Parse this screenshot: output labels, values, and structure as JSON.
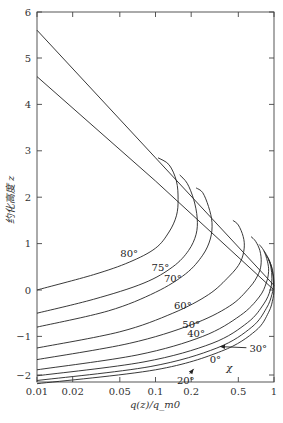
{
  "chart_data": {
    "type": "line",
    "title": "",
    "xlabel": "q(z)/q_m0",
    "ylabel": "约化高度 z",
    "xscale": "log",
    "xlim": [
      0.01,
      1
    ],
    "ylim": [
      -2.15,
      6
    ],
    "x_ticks": [
      0.01,
      0.02,
      0.05,
      0.1,
      0.2,
      0.5,
      1
    ],
    "x_tick_labels": [
      "0.01",
      "0.02",
      "0.05",
      "0.1",
      "0.2",
      "0.5",
      "1"
    ],
    "y_ticks": [
      -2,
      -1,
      0,
      1,
      2,
      3,
      4,
      5,
      6
    ],
    "y_tick_labels": [
      "−2",
      "−1",
      "0",
      "1",
      "2",
      "3",
      "4",
      "5",
      "6"
    ],
    "grid": false,
    "legend": "none (inline labels)",
    "lines": [
      {
        "name": "upper straight line",
        "x": [
          0.01,
          0.1,
          1
        ],
        "y": [
          5.6,
          2.85,
          0.1
        ]
      },
      {
        "name": "lower straight line",
        "x": [
          0.01,
          0.1,
          1
        ],
        "y": [
          4.6,
          2.35,
          0.0
        ]
      }
    ],
    "series": [
      {
        "name": "80°",
        "x": [
          0.01,
          0.03,
          0.06,
          0.1,
          0.13,
          0.15,
          0.155,
          0.15,
          0.13,
          0.105
        ],
        "y": [
          0.0,
          0.33,
          0.6,
          0.9,
          1.25,
          1.6,
          1.95,
          2.35,
          2.7,
          2.85
        ]
      },
      {
        "name": "75°",
        "x": [
          0.01,
          0.03,
          0.08,
          0.14,
          0.19,
          0.22,
          0.225,
          0.21,
          0.185,
          0.16
        ],
        "y": [
          -0.5,
          -0.2,
          0.15,
          0.5,
          0.85,
          1.2,
          1.55,
          1.95,
          2.3,
          2.48
        ]
      },
      {
        "name": "70°",
        "x": [
          0.01,
          0.04,
          0.1,
          0.18,
          0.25,
          0.29,
          0.3,
          0.28,
          0.25,
          0.22
        ],
        "y": [
          -0.8,
          -0.45,
          -0.05,
          0.35,
          0.75,
          1.1,
          1.45,
          1.8,
          2.1,
          2.2
        ]
      },
      {
        "name": "60°",
        "x": [
          0.01,
          0.05,
          0.14,
          0.28,
          0.42,
          0.52,
          0.56,
          0.55,
          0.5,
          0.45
        ],
        "y": [
          -1.25,
          -0.9,
          -0.5,
          -0.1,
          0.3,
          0.6,
          0.9,
          1.15,
          1.4,
          1.5
        ]
      },
      {
        "name": "50°",
        "x": [
          0.01,
          0.06,
          0.2,
          0.42,
          0.62,
          0.74,
          0.78,
          0.76,
          0.7,
          0.64
        ],
        "y": [
          -1.5,
          -1.15,
          -0.75,
          -0.35,
          0.05,
          0.35,
          0.6,
          0.85,
          1.05,
          1.15
        ]
      },
      {
        "name": "40°",
        "x": [
          0.01,
          0.07,
          0.25,
          0.52,
          0.75,
          0.86,
          0.9,
          0.88,
          0.82,
          0.75
        ],
        "y": [
          -1.72,
          -1.4,
          -1.0,
          -0.55,
          -0.15,
          0.15,
          0.4,
          0.62,
          0.85,
          0.98
        ]
      },
      {
        "name": "30°",
        "x": [
          0.01,
          0.08,
          0.3,
          0.6,
          0.82,
          0.93,
          0.96,
          0.94,
          0.88,
          0.82
        ],
        "y": [
          -1.85,
          -1.55,
          -1.15,
          -0.7,
          -0.3,
          0.0,
          0.25,
          0.5,
          0.72,
          0.85
        ]
      },
      {
        "name": "20°",
        "x": [
          0.01,
          0.09,
          0.33,
          0.65,
          0.86,
          0.96,
          0.99,
          0.97,
          0.92,
          0.86
        ],
        "y": [
          -1.95,
          -1.65,
          -1.25,
          -0.8,
          -0.4,
          -0.1,
          0.15,
          0.4,
          0.62,
          0.75
        ]
      },
      {
        "name": "0°",
        "x": [
          0.01,
          0.1,
          0.36,
          0.7,
          0.9,
          0.98,
          1.0,
          0.99,
          0.95,
          0.9
        ],
        "y": [
          -2.02,
          -1.72,
          -1.32,
          -0.88,
          -0.48,
          -0.18,
          0.05,
          0.3,
          0.52,
          0.65
        ]
      }
    ],
    "annotations": [
      {
        "text": "80°",
        "x": 0.06,
        "y": 0.72
      },
      {
        "text": "75°",
        "x": 0.11,
        "y": 0.42
      },
      {
        "text": "70°",
        "x": 0.14,
        "y": 0.17
      },
      {
        "text": "60°",
        "x": 0.17,
        "y": -0.4
      },
      {
        "text": "50°",
        "x": 0.2,
        "y": -0.82
      },
      {
        "text": "40°",
        "x": 0.22,
        "y": -1.02
      },
      {
        "text": "30°",
        "x": 0.62,
        "y": -1.33,
        "arrow_to": {
          "x": 0.35,
          "y": -1.22
        }
      },
      {
        "text": "20°",
        "x": 0.18,
        "y": -2.02,
        "arrow_to": {
          "x": 0.21,
          "y": -1.7
        }
      },
      {
        "text": "0°",
        "x": 0.32,
        "y": -1.57
      },
      {
        "text": "χ",
        "x": 0.42,
        "y": -1.75
      }
    ]
  }
}
